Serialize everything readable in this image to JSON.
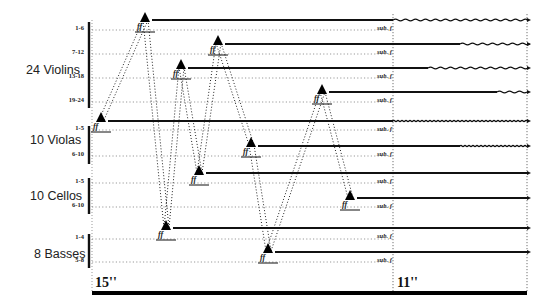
{
  "sections": [
    {
      "label": "24 Violins",
      "x": 26,
      "y": 63
    },
    {
      "label": "10 Violas",
      "x": 30,
      "y": 133
    },
    {
      "label": "10 Cellos",
      "x": 30,
      "y": 189
    },
    {
      "label": "8 Basses",
      "x": 34,
      "y": 247
    }
  ],
  "sub_labels": [
    {
      "text": "1-6",
      "y": 28
    },
    {
      "text": "7-12",
      "y": 52
    },
    {
      "text": "13-18",
      "y": 76
    },
    {
      "text": "19-24",
      "y": 100
    },
    {
      "text": "1-5",
      "y": 128
    },
    {
      "text": "6-10",
      "y": 154
    },
    {
      "text": "1-5",
      "y": 181
    },
    {
      "text": "6-10",
      "y": 205
    },
    {
      "text": "1-4",
      "y": 237
    },
    {
      "text": "5-8",
      "y": 260
    }
  ],
  "dynamic_marking": "ff",
  "subito_marking": "sub. f",
  "time_markers": {
    "start": "15''",
    "end": "11''"
  },
  "entries": [
    {
      "group": "Violins 1-6",
      "tri_x": 145,
      "tri_y": 18,
      "line_y": 20,
      "wave_start": 393
    },
    {
      "group": "Violins 7-12",
      "tri_x": 218,
      "tri_y": 41,
      "line_y": 44,
      "wave_start": 460
    },
    {
      "group": "Violins 13-18",
      "tri_x": 181,
      "tri_y": 65,
      "line_y": 68,
      "wave_start": 428
    },
    {
      "group": "Violins 19-24",
      "tri_x": 322,
      "tri_y": 90,
      "line_y": 92,
      "wave_start": 497
    },
    {
      "group": "Violas 1-5",
      "tri_x": 101,
      "tri_y": 118,
      "line_y": 121,
      "wave_start": 393,
      "wave_style": "dense"
    },
    {
      "group": "Violas 6-10",
      "tri_x": 251,
      "tri_y": 143,
      "line_y": 146,
      "wave_start": 460,
      "wave_style": "dense"
    },
    {
      "group": "Cellos 1-5",
      "tri_x": 199,
      "tri_y": 171,
      "line_y": 173,
      "wave_start": null
    },
    {
      "group": "Cellos 6-10",
      "tri_x": 350,
      "tri_y": 196,
      "line_y": 198,
      "wave_start": null
    },
    {
      "group": "Basses 1-4",
      "tri_x": 166,
      "tri_y": 226,
      "line_y": 228,
      "wave_start": null
    },
    {
      "group": "Basses 5-8",
      "tri_x": 268,
      "tri_y": 249,
      "line_y": 252,
      "wave_start": null
    }
  ]
}
